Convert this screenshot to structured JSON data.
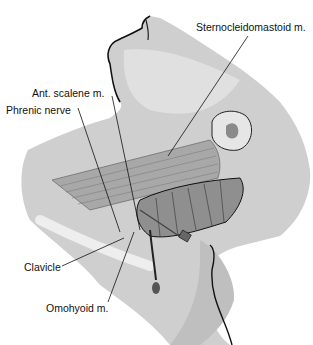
{
  "figure": {
    "labels": [
      {
        "id": "sternocleidomastoid",
        "text": "Sternocleidomastoid m."
      },
      {
        "id": "ant-scalene",
        "text": "Ant. scalene m."
      },
      {
        "id": "phrenic-nerve",
        "text": "Phrenic nerve"
      },
      {
        "id": "clavicle",
        "text": "Clavicle"
      },
      {
        "id": "omohyoid",
        "text": "Omohyoid m."
      }
    ],
    "colors": {
      "skin_light": "#d9d9d9",
      "skin_mid": "#bdbdbd",
      "skin_dark": "#9a9a9a",
      "muscle": "#8c8c8c",
      "outline": "#111111"
    }
  }
}
